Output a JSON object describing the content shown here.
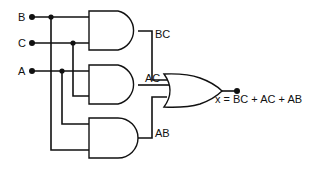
{
  "diagram": {
    "type": "logic-circuit",
    "inputs": [
      {
        "name": "B",
        "label": "B"
      },
      {
        "name": "C",
        "label": "C"
      },
      {
        "name": "A",
        "label": "A"
      }
    ],
    "gates": [
      {
        "id": "and1",
        "type": "AND",
        "inputs": [
          "B",
          "C"
        ],
        "output_label": "BC"
      },
      {
        "id": "and2",
        "type": "AND",
        "inputs": [
          "A",
          "C"
        ],
        "output_label": "AC"
      },
      {
        "id": "and3",
        "type": "AND",
        "inputs": [
          "A",
          "B"
        ],
        "output_label": "AB"
      },
      {
        "id": "or1",
        "type": "OR",
        "inputs": [
          "BC",
          "AC",
          "AB"
        ]
      }
    ],
    "output_label": "x = BC + AC + AB"
  }
}
